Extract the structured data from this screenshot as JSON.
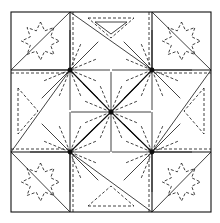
{
  "colors": {
    "line": "#111111",
    "background": "#ffffff"
  },
  "elements": {
    "corner_stars": [
      "top-left",
      "top-right",
      "bottom-left",
      "bottom-right"
    ],
    "hubs": [
      "top-left",
      "top-right",
      "center",
      "bottom-left",
      "bottom-right"
    ]
  }
}
